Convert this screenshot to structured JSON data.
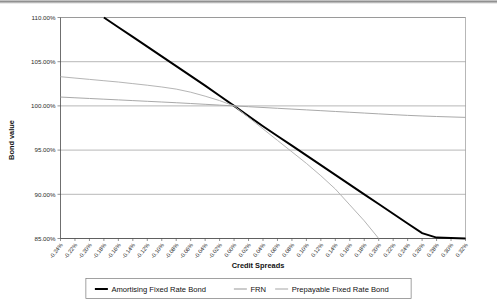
{
  "chart_data": {
    "type": "line",
    "title": "",
    "xlabel": "Credit Spreads",
    "ylabel": "Bond value",
    "grid": true,
    "legend_position": "bottom",
    "xlim": [
      -0.24,
      0.32
    ],
    "ylim": [
      85,
      110
    ],
    "yticks": [
      85,
      90,
      95,
      100,
      105,
      110
    ],
    "ytick_labels": [
      "85.00%",
      "90.00%",
      "95.00%",
      "100.00%",
      "105.00%",
      "110.00%"
    ],
    "x": [
      -0.24,
      -0.22,
      -0.2,
      -0.18,
      -0.16,
      -0.14,
      -0.12,
      -0.1,
      -0.08,
      -0.06,
      -0.04,
      -0.02,
      0.0,
      0.02,
      0.04,
      0.06,
      0.08,
      0.1,
      0.12,
      0.14,
      0.16,
      0.18,
      0.2,
      0.22,
      0.24,
      0.26,
      0.28,
      0.3,
      0.32
    ],
    "xtick_labels": [
      "-0.24%",
      "-0.22%",
      "-0.20%",
      "-0.18%",
      "-0.16%",
      "-0.14%",
      "-0.12%",
      "-0.10%",
      "-0.08%",
      "-0.06%",
      "-0.04%",
      "-0.02%",
      "0.00%",
      "0.02%",
      "0.04%",
      "0.06%",
      "0.08%",
      "0.10%",
      "0.12%",
      "0.14%",
      "0.16%",
      "0.18%",
      "0.20%",
      "0.22%",
      "0.24%",
      "0.26%",
      "0.28%",
      "0.30%",
      "0.32%"
    ],
    "series": [
      {
        "name": "Amortising Fixed Rate Bond",
        "color": "#000000",
        "x": [
          -0.18,
          -0.16,
          -0.14,
          -0.12,
          -0.1,
          -0.08,
          -0.06,
          -0.04,
          -0.02,
          0.0,
          0.02,
          0.04,
          0.06,
          0.08,
          0.1,
          0.12,
          0.14,
          0.16,
          0.18,
          0.2,
          0.22,
          0.24,
          0.26,
          0.28,
          0.3,
          0.32
        ],
        "values": [
          110.0,
          108.9,
          107.8,
          106.7,
          105.6,
          104.5,
          103.4,
          102.3,
          101.15,
          100.0,
          98.85,
          97.7,
          96.6,
          95.5,
          94.4,
          93.3,
          92.2,
          91.1,
          90.0,
          88.9,
          87.8,
          86.7,
          85.6,
          85.1,
          85.05,
          85.0
        ]
      },
      {
        "name": "FRN",
        "color": "#a9a9a9",
        "x": [
          -0.24,
          -0.22,
          -0.2,
          -0.18,
          -0.16,
          -0.14,
          -0.12,
          -0.1,
          -0.08,
          -0.06,
          -0.04,
          -0.02,
          0.0,
          0.02,
          0.04,
          0.06,
          0.08,
          0.1,
          0.12,
          0.14,
          0.16,
          0.18,
          0.2,
          0.22,
          0.24,
          0.26,
          0.28,
          0.3,
          0.32
        ],
        "values": [
          101.0,
          100.92,
          100.84,
          100.76,
          100.68,
          100.6,
          100.52,
          100.44,
          100.36,
          100.27,
          100.18,
          100.09,
          100.0,
          99.91,
          99.82,
          99.73,
          99.64,
          99.55,
          99.46,
          99.37,
          99.28,
          99.19,
          99.1,
          99.01,
          98.93,
          98.86,
          98.8,
          98.75,
          98.7
        ]
      },
      {
        "name": "Prepayable Fixed Rate Bond",
        "color": "#b5b5b5",
        "x": [
          -0.24,
          -0.22,
          -0.2,
          -0.18,
          -0.16,
          -0.14,
          -0.12,
          -0.1,
          -0.08,
          -0.06,
          -0.04,
          -0.02,
          0.0,
          0.02,
          0.04,
          0.06,
          0.08,
          0.1,
          0.12,
          0.14,
          0.16,
          0.18,
          0.2
        ],
        "values": [
          103.3,
          103.15,
          103.0,
          102.85,
          102.7,
          102.52,
          102.34,
          102.14,
          101.9,
          101.55,
          101.1,
          100.6,
          100.0,
          98.7,
          97.4,
          96.1,
          94.8,
          93.5,
          92.1,
          90.6,
          88.8,
          87.0,
          85.0
        ]
      }
    ]
  },
  "legend": {
    "items": [
      {
        "label": "Amortising Fixed Rate Bond"
      },
      {
        "label": "FRN"
      },
      {
        "label": "Prepayable Fixed Rate Bond"
      }
    ]
  }
}
